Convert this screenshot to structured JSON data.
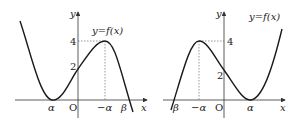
{
  "figures": [
    {
      "id": "left",
      "curve_label": "y=f(x)",
      "axis_labels": {
        "x": "x",
        "y": "y",
        "origin": "O"
      },
      "y_ticks": [
        "4",
        "2"
      ],
      "x_ticks": [
        "α",
        "−α",
        "β"
      ],
      "points": {
        "local_min": "(α, 0)",
        "local_max": "(−α, 4)",
        "y_intercept": "2",
        "root": "β"
      }
    },
    {
      "id": "right",
      "curve_label": "y=f(x)",
      "axis_labels": {
        "x": "x",
        "y": "y",
        "origin": "O"
      },
      "y_ticks": [
        "4",
        "2"
      ],
      "x_ticks": [
        "β",
        "−α",
        "α"
      ],
      "points": {
        "local_min": "(α, 0)",
        "local_max": "(−α, 4)",
        "y_intercept": "2",
        "root": "β"
      }
    }
  ],
  "colors": {
    "curve": "#1a1a1a",
    "axis": "#333333",
    "dashed": "#555555"
  }
}
